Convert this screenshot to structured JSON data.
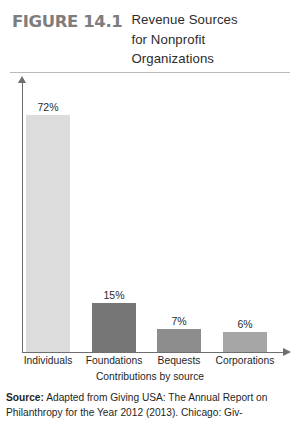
{
  "figure": {
    "number_label": "FIGURE 14.1",
    "title_lines": [
      "Revenue Sources",
      "for Nonprofit",
      "Organizations"
    ]
  },
  "source": {
    "label": "Source:",
    "text": " Adapted from Giving USA: The Annual Report on Philanthropy for the Year 2012 (2013). Chicago: Giv-"
  },
  "chart_data": {
    "type": "bar",
    "title": "Revenue Sources for Nonprofit Organizations",
    "xlabel": "Contributions by source",
    "ylabel": "",
    "ylim": [
      0,
      80
    ],
    "grid": false,
    "legend": "none",
    "categories": [
      "Individuals",
      "Foundations",
      "Bequests",
      "Corporations"
    ],
    "values": [
      72,
      15,
      7,
      6
    ],
    "value_labels": [
      "72%",
      "15%",
      "7%",
      "6%"
    ],
    "bar_colors": [
      "#dcdcdc",
      "#767676",
      "#8d8d8d",
      "#a6a6a6"
    ],
    "axis_color": "#6e6e6e"
  }
}
